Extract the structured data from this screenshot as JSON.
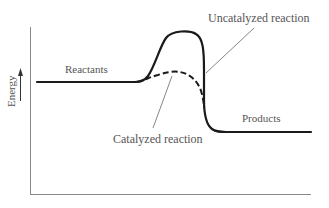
{
  "diagram": {
    "y_axis_label": "Energy",
    "labels": {
      "reactants": "Reactants",
      "products": "Products",
      "uncatalyzed": "Uncatalyzed reaction",
      "catalyzed": "Catalyzed reaction"
    },
    "colors": {
      "curve": "#1a1a1a",
      "axis": "#888888",
      "text": "#555555",
      "background": "#ffffff"
    },
    "curves": [
      {
        "name": "Uncatalyzed reaction",
        "style": "solid",
        "start_level": "reactants",
        "peak": "high",
        "end_level": "products"
      },
      {
        "name": "Catalyzed reaction",
        "style": "dashed",
        "start_level": "reactants",
        "peak": "low",
        "end_level": "products"
      }
    ]
  }
}
